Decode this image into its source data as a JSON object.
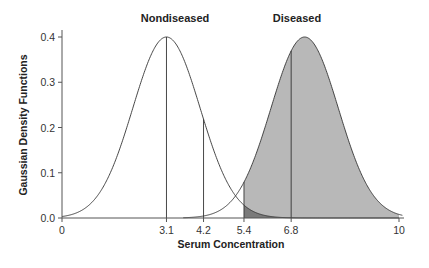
{
  "chart_data": {
    "type": "area",
    "title": "",
    "xlabel": "Serum Concentration",
    "ylabel": "Gaussian Density Functions",
    "xlim": [
      0,
      10
    ],
    "ylim": [
      0,
      0.4
    ],
    "grid": false,
    "x_ticks": [
      0,
      3.1,
      4.2,
      5.4,
      6.8,
      10
    ],
    "x_tick_labels": [
      "0",
      "3.1",
      "4.2",
      "5.4",
      "6.8",
      "10"
    ],
    "y_ticks": [
      0.0,
      0.1,
      0.2,
      0.3,
      0.4
    ],
    "y_tick_labels": [
      "0.0",
      "0.1",
      "0.2",
      "0.3",
      "0.4"
    ],
    "series": [
      {
        "name": "Nondiseased",
        "distribution": "gaussian",
        "mean": 3.1,
        "sd": 1.0,
        "peak": 0.4,
        "fill": "none"
      },
      {
        "name": "Diseased",
        "distribution": "gaussian",
        "mean": 7.2,
        "sd": 1.0,
        "peak": 0.4,
        "fill": "#b8b8b8",
        "shade_from": 5.4,
        "shade_to": 10
      }
    ],
    "vertical_lines": [
      3.1,
      4.2,
      5.4,
      6.8
    ],
    "shaded_overlap": {
      "from": 5.4,
      "to": 10,
      "color": "#7a7a7a",
      "description": "Nondiseased tail beyond cutoff 5.4"
    },
    "annotations": [
      {
        "text": "Nondiseased",
        "x": 3.1
      },
      {
        "text": "Diseased",
        "x": 7.2
      }
    ]
  },
  "labels": {
    "nondiseased": "Nondiseased",
    "diseased": "Diseased",
    "xlabel": "Serum Concentration",
    "ylabel": "Gaussian Density Functions",
    "x_ticks": [
      "0",
      "3.1",
      "4.2",
      "5.4",
      "6.8",
      "10"
    ],
    "y_ticks": [
      "0.0",
      "0.1",
      "0.2",
      "0.3",
      "0.4"
    ]
  }
}
